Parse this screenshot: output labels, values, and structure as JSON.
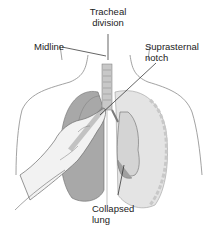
{
  "figure": {
    "labels": {
      "tracheal_division": [
        "Tracheal",
        "division"
      ],
      "midline": "Midline",
      "suprasternal_notch": [
        "Suprasternal",
        "notch"
      ],
      "collapsed_lung": [
        "Collapsed",
        "lung"
      ]
    },
    "colors": {
      "outline": "#6a6a6a",
      "lung_light": "#d8d8d8",
      "lung_dark": "#9a9a9a",
      "skin": "#f2f2f2",
      "leader_line": "#222222"
    }
  }
}
